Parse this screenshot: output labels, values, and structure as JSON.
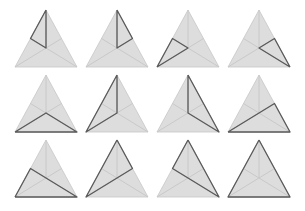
{
  "figure": {
    "rows": 3,
    "columns": 4,
    "colors": {
      "background": "#ffffff",
      "fill": "#dddddd",
      "guide_line": "#c6c6c6",
      "highlight_line": "#5a5a5a"
    },
    "geometry": {
      "col_left_x": [
        15,
        86,
        157,
        228
      ],
      "row_apex_y": [
        10,
        75,
        140
      ],
      "width": 62,
      "height": 57
    },
    "points_legend": {
      "A": "apex",
      "B": "bottom-left vertex",
      "C": "bottom-right vertex",
      "D": "centroid",
      "L": "midpoint of left edge AB",
      "R": "midpoint of right edge AC"
    },
    "triangles": [
      {
        "id": 1,
        "highlight": [
          "A",
          "L",
          "D",
          "A"
        ]
      },
      {
        "id": 2,
        "highlight": [
          "A",
          "R",
          "D",
          "A"
        ]
      },
      {
        "id": 3,
        "highlight": [
          "B",
          "L",
          "D",
          "B"
        ]
      },
      {
        "id": 4,
        "highlight": [
          "C",
          "R",
          "D",
          "C"
        ]
      },
      {
        "id": 5,
        "highlight": [
          "B",
          "D",
          "C",
          "B"
        ]
      },
      {
        "id": 6,
        "highlight": [
          "A",
          "D",
          "B",
          "A"
        ]
      },
      {
        "id": 7,
        "highlight": [
          "A",
          "D",
          "C",
          "A"
        ]
      },
      {
        "id": 8,
        "highlight": [
          "B",
          "C",
          "R",
          "B"
        ]
      },
      {
        "id": 9,
        "highlight": [
          "B",
          "C",
          "L",
          "B"
        ]
      },
      {
        "id": 10,
        "highlight": [
          "A",
          "B",
          "R",
          "A"
        ]
      },
      {
        "id": 11,
        "highlight": [
          "A",
          "C",
          "L",
          "A"
        ]
      },
      {
        "id": 12,
        "highlight": [
          "A",
          "B",
          "C",
          "A"
        ]
      }
    ]
  }
}
